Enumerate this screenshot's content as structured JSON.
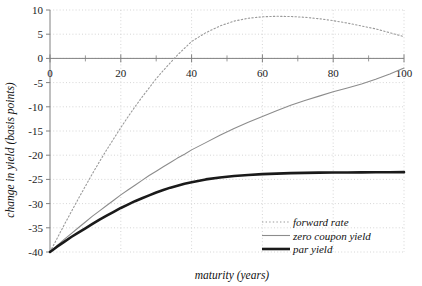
{
  "chart_data": {
    "type": "line",
    "title": "",
    "xlabel": "maturity (years)",
    "ylabel": "change in yield (basis points)",
    "xlim": [
      0,
      100
    ],
    "ylim": [
      -40,
      10
    ],
    "xticks": [
      0,
      20,
      40,
      60,
      80,
      100
    ],
    "xticklabels": [
      "0",
      "20",
      "40",
      "60",
      "80",
      "100"
    ],
    "xminorticks": [
      10,
      30,
      50,
      70,
      90
    ],
    "yticks": [
      10,
      5,
      0,
      -5,
      -10,
      -15,
      -20,
      -25,
      -30,
      -35,
      -40
    ],
    "yticklabels": [
      "10",
      "5",
      "0",
      "-5",
      "-10",
      "-15",
      "-20",
      "-25",
      "-30",
      "-35",
      "-40"
    ],
    "grid": true,
    "grid_style": "dotted",
    "grid_color": "#cccccc",
    "axis_color": "#808080",
    "legend_position": "lower right",
    "x": [
      0,
      2,
      4,
      6,
      8,
      10,
      12,
      14,
      16,
      18,
      20,
      22,
      24,
      26,
      28,
      30,
      32,
      34,
      36,
      38,
      40,
      44,
      48,
      52,
      56,
      60,
      64,
      68,
      72,
      76,
      80,
      84,
      88,
      92,
      96,
      100
    ],
    "series": [
      {
        "name": "forward rate",
        "style": "dotted",
        "color": "#9a9a9a",
        "width": 1.1,
        "values": [
          -40,
          -37.2,
          -34.4,
          -31.7,
          -29.0,
          -26.4,
          -23.8,
          -21.3,
          -18.9,
          -16.6,
          -14.3,
          -12.1,
          -10.0,
          -8.0,
          -6.1,
          -4.2,
          -2.5,
          -0.9,
          0.7,
          2.1,
          3.5,
          5.3,
          6.7,
          7.7,
          8.3,
          8.6,
          8.7,
          8.65,
          8.5,
          8.2,
          7.8,
          7.3,
          6.7,
          6.1,
          5.3,
          4.5
        ]
      },
      {
        "name": "zero coupon yield",
        "style": "solid-thin",
        "color": "#8c8c8c",
        "width": 1.1,
        "values": [
          -40,
          -38.7,
          -37.4,
          -36.2,
          -35.0,
          -33.8,
          -32.6,
          -31.5,
          -30.4,
          -29.3,
          -28.2,
          -27.2,
          -26.2,
          -25.2,
          -24.2,
          -23.3,
          -22.4,
          -21.5,
          -20.6,
          -19.8,
          -18.9,
          -17.4,
          -15.9,
          -14.5,
          -13.2,
          -12.0,
          -10.8,
          -9.7,
          -8.7,
          -7.8,
          -6.9,
          -6.1,
          -5.3,
          -4.3,
          -3.2,
          -2.0
        ]
      },
      {
        "name": "par yield",
        "style": "solid-thick",
        "color": "#1a1a1a",
        "width": 2.6,
        "values": [
          -40,
          -38.9,
          -37.9,
          -36.9,
          -36.0,
          -35.1,
          -34.2,
          -33.3,
          -32.5,
          -31.7,
          -30.9,
          -30.2,
          -29.5,
          -28.9,
          -28.3,
          -27.7,
          -27.2,
          -26.7,
          -26.3,
          -25.9,
          -25.6,
          -25.0,
          -24.6,
          -24.3,
          -24.1,
          -23.9,
          -23.8,
          -23.7,
          -23.65,
          -23.6,
          -23.58,
          -23.56,
          -23.54,
          -23.52,
          -23.51,
          -23.5
        ]
      }
    ]
  },
  "legend": {
    "items": [
      {
        "label": "forward rate"
      },
      {
        "label": "zero coupon yield"
      },
      {
        "label": "par yield"
      }
    ]
  }
}
